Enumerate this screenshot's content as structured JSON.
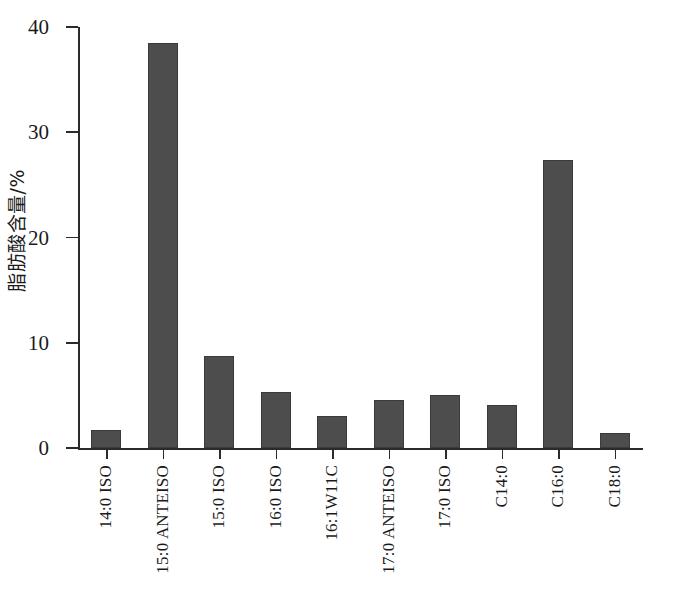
{
  "chart_data": {
    "type": "bar",
    "title": "",
    "xlabel": "",
    "ylabel": "脂肪酸含量/%",
    "ylim": [
      0,
      40
    ],
    "yticks": [
      0,
      10,
      20,
      30,
      40
    ],
    "grid": false,
    "legend": false,
    "bar_color": "#4d4d4d",
    "axis_color": "#2b2b2b",
    "categories": [
      "14:0 ISO",
      "15:0 ANTEISO",
      "15:0 ISO",
      "16:0 ISO",
      "16:1W11C",
      "17:0 ANTEISO",
      "17:0 ISO",
      "C14:0",
      "C16:0",
      "C18:0"
    ],
    "values": [
      1.7,
      38.5,
      8.7,
      5.3,
      3.0,
      4.6,
      5.0,
      4.1,
      27.4,
      1.4
    ]
  }
}
